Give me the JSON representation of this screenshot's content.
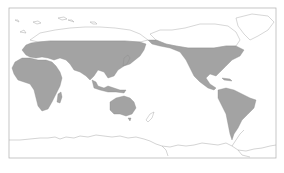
{
  "map": {
    "projection": "world map, Pacific-centered (Eurasia/Africa on left, Americas on right)",
    "colors": {
      "background": "#ffffff",
      "frame": "#b8b8b8",
      "shaded_region": "#a3a3a3",
      "unshaded_outline": "#9a9a9a"
    },
    "shaded_regions": [
      "Europe (southern/central)",
      "Africa",
      "Asia (south of ~60°N)",
      "Southeast Asia / Indonesia",
      "Australia",
      "North America (USA, southern Canada, Mexico)",
      "Central America and Caribbean",
      "South America"
    ],
    "unshaded_regions": [
      "Arctic Russia / Siberia north",
      "Northern Canada / Arctic archipelago",
      "Greenland",
      "New Zealand",
      "Antarctica"
    ]
  }
}
